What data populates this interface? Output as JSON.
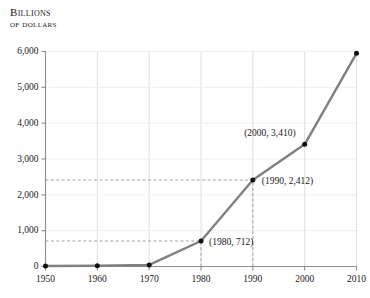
{
  "chart_data": {
    "type": "line",
    "title": "Billions of dollars",
    "title_line1": "Billions",
    "title_line2": "of dollars",
    "xlabel": "",
    "ylabel": "Billions of dollars",
    "x": [
      1950,
      1960,
      1970,
      1980,
      1990,
      2000,
      2010
    ],
    "values": [
      13,
      20,
      43,
      712,
      2412,
      3410,
      5950
    ],
    "series": [
      {
        "name": "Billions of dollars",
        "values": [
          13,
          20,
          43,
          712,
          2412,
          3410,
          5950
        ]
      }
    ],
    "xlim": [
      1950,
      2010
    ],
    "ylim": [
      0,
      6000
    ],
    "xticks": [
      1950,
      1960,
      1970,
      1980,
      1990,
      2000,
      2010
    ],
    "xtick_labels": [
      "1950",
      "1960",
      "1970",
      "1980",
      "1990",
      "2000",
      "2010"
    ],
    "yticks": [
      0,
      1000,
      2000,
      3000,
      4000,
      5000,
      6000
    ],
    "ytick_labels": [
      "0",
      "1,000",
      "2,000",
      "3,000",
      "4,000",
      "5,000",
      "6,000"
    ],
    "grid": true,
    "legend": false,
    "line_color": "#808080",
    "marker_color": "#111111",
    "grid_color": "#d8d8d8",
    "axis_color": "#8d8d8d",
    "annotations": [
      {
        "text": "(1980, 712)",
        "x": 1980,
        "y": 712
      },
      {
        "text": "(1990, 2,412)",
        "x": 1990,
        "y": 2412
      },
      {
        "text": "(2000, 3,410)",
        "x": 2000,
        "y": 3410
      }
    ],
    "guide_lines": [
      {
        "type": "horizontal",
        "value": 712,
        "from_x": 1950,
        "to_x": 1980
      },
      {
        "type": "vertical",
        "value": 1980,
        "from_y": 0,
        "to_y": 712
      },
      {
        "type": "horizontal",
        "value": 2412,
        "from_x": 1950,
        "to_x": 1990
      },
      {
        "type": "vertical",
        "value": 1990,
        "from_y": 0,
        "to_y": 2412
      }
    ]
  }
}
